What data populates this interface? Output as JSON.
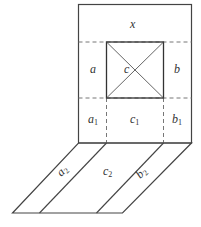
{
  "diagram": {
    "type": "net / folded box diagram",
    "labels": {
      "x": "x",
      "a": "a",
      "c": "c",
      "b": "b",
      "a1": {
        "base": "a",
        "sub": "1"
      },
      "c1": {
        "base": "c",
        "sub": "1"
      },
      "b1": {
        "base": "b",
        "sub": "1"
      },
      "a2": {
        "base": "a",
        "sub": "2"
      },
      "c2": {
        "base": "c",
        "sub": "2"
      },
      "b2": {
        "base": "b",
        "sub": "2"
      }
    },
    "colors": {
      "stroke": "#444444",
      "dashed": "#777777",
      "background": "#ffffff"
    }
  }
}
